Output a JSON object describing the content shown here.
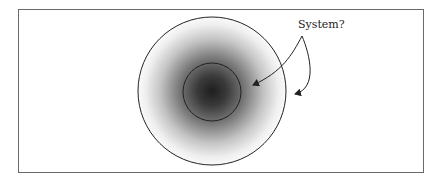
{
  "diagram": {
    "label": "System?",
    "shapes": {
      "outer_circle": {
        "cx": 212,
        "cy": 91,
        "r": 74
      },
      "inner_circle": {
        "cx": 212,
        "cy": 92,
        "r": 29
      }
    },
    "colors": {
      "stroke": "#222222",
      "frame": "#6a6a6a",
      "gradient_center": "#1e1e1e",
      "gradient_edge": "#ffffff"
    },
    "arrows": [
      {
        "from": "label",
        "to": "region-between-circles"
      },
      {
        "from": "label",
        "to": "outside-outer-circle"
      }
    ]
  }
}
